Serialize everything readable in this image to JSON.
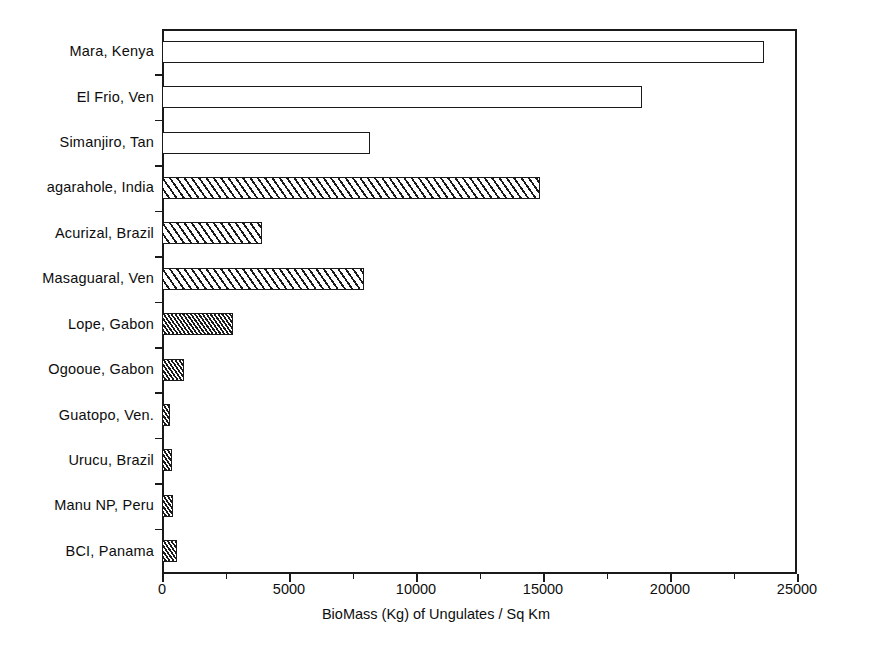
{
  "chart_data": {
    "type": "bar",
    "orientation": "horizontal",
    "title": "",
    "xlabel": "BioMass (Kg) of Ungulates / Sq Km",
    "ylabel": "",
    "xlim": [
      0,
      25000
    ],
    "xticks": [
      0,
      5000,
      10000,
      15000,
      20000,
      25000
    ],
    "xticklabels": [
      "0",
      "5000",
      "10000",
      "15000",
      "20000",
      "25000"
    ],
    "minor_tick_interval": 2500,
    "grid": false,
    "legend": "none",
    "categories": [
      "Mara, Kenya",
      "El Frio, Ven",
      "Simanjiro, Tan",
      "agarahole, India",
      "Acurizal, Brazil",
      "Masaguaral, Ven",
      "Lope, Gabon",
      "Ogooue, Gabon",
      "Guatopo, Ven.",
      "Urucu, Brazil",
      "Manu NP, Peru",
      "BCI, Panama"
    ],
    "values": [
      23700,
      18900,
      8200,
      14900,
      3950,
      7950,
      2800,
      850,
      320,
      380,
      450,
      600
    ],
    "bar_patterns": [
      "none",
      "none",
      "none",
      "hatch-wide",
      "hatch-wide",
      "hatch-wide",
      "hatch-dense",
      "hatch-dense",
      "hatch-dense",
      "hatch-dense",
      "hatch-dense",
      "hatch-dense"
    ],
    "colors": {
      "bar_edge": "#1a1a1a",
      "bar_fill": "#ffffff",
      "hatch": "#1a1a1a",
      "axis": "#1a1a1a",
      "text": "#0d0d0d",
      "background": "#ffffff"
    }
  }
}
